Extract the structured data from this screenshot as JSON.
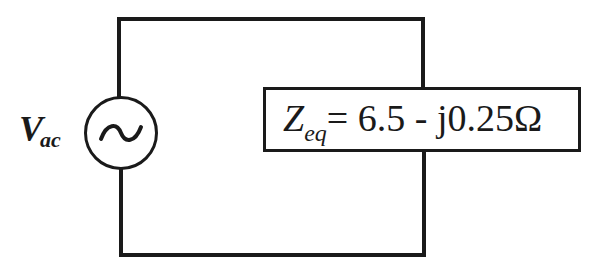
{
  "diagram": {
    "type": "circuit",
    "source": {
      "symbol": "ac-voltage-source",
      "glyph": "~",
      "label_main": "V",
      "label_sub": "ac"
    },
    "load": {
      "symbol": "impedance-box",
      "label_main": "Z",
      "label_sub": "eq",
      "expression": "= 6.5 - j0.25Ω",
      "real_part": 6.5,
      "imag_part": -0.25,
      "unit": "Ω"
    },
    "colors": {
      "line": "#1a1a1a",
      "background": "#ffffff"
    }
  }
}
